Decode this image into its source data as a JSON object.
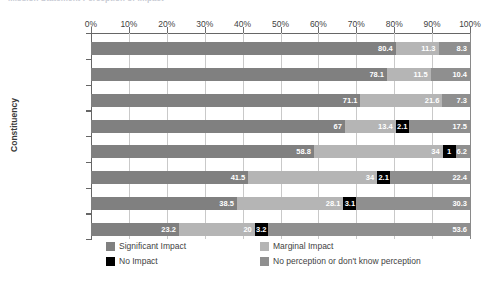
{
  "title": "Mission Statement Perception of Impact",
  "axes": {
    "y_axis_title": "Constituency",
    "x_ticks": [
      "0%",
      "10%",
      "20%",
      "30%",
      "40%",
      "50%",
      "60%",
      "70%",
      "80%",
      "90%",
      "100%"
    ]
  },
  "legend": {
    "items": [
      {
        "label": "Significant Impact",
        "color": "#808080"
      },
      {
        "label": "Marginal Impact",
        "color": "#b5b5b5"
      },
      {
        "label": "No Impact",
        "color": "#000000"
      },
      {
        "label": "No perception or don't know perception",
        "color": "#8f8f8f"
      }
    ]
  },
  "chart_data": {
    "type": "bar",
    "orientation": "horizontal",
    "stacked": true,
    "title": "Mission Statement Perception of Impact",
    "xlabel": "",
    "ylabel": "Constituency",
    "xlim": [
      0,
      100
    ],
    "xtick_labels": [
      "0%",
      "10%",
      "20%",
      "30%",
      "40%",
      "50%",
      "60%",
      "70%",
      "80%",
      "90%",
      "100%"
    ],
    "grid": true,
    "legend_position": "bottom",
    "categories": [
      "Administrators",
      "Sponsoring R.C.",
      "Staff",
      "Trustees",
      "Faculty",
      "Students",
      "Alumni",
      "Diocese"
    ],
    "series": [
      {
        "name": "Significant Impact",
        "color": "#808080",
        "values": [
          80.4,
          78.1,
          71.1,
          67,
          58.8,
          41.5,
          38.5,
          23.2
        ],
        "labels": [
          "80.4",
          "78.1",
          "71.1",
          "67",
          "58.8",
          "41.5",
          "38.5",
          "23.2"
        ]
      },
      {
        "name": "Marginal Impact",
        "color": "#b5b5b5",
        "values": [
          11.3,
          11.5,
          21.6,
          13.4,
          34,
          34,
          28.1,
          20
        ],
        "labels": [
          "11.3",
          "11.5",
          "21.6",
          "13.4",
          "34",
          "34",
          "28.1",
          "20"
        ]
      },
      {
        "name": "No Impact",
        "color": "#000000",
        "values": [
          0,
          0,
          0,
          2.1,
          1,
          2.1,
          3.1,
          3.2
        ],
        "labels": [
          "",
          "",
          "",
          "2.1",
          "1",
          "2.1",
          "3.1",
          "3.2"
        ]
      },
      {
        "name": "No perception or don't know perception",
        "color": "#8f8f8f",
        "values": [
          8.3,
          10.4,
          7.3,
          17.5,
          6.2,
          22.4,
          30.3,
          53.6
        ],
        "labels": [
          "8.3",
          "10.4",
          "7.3",
          "17.5",
          "6.2",
          "22.4",
          "30.3",
          "53.6"
        ]
      }
    ]
  }
}
